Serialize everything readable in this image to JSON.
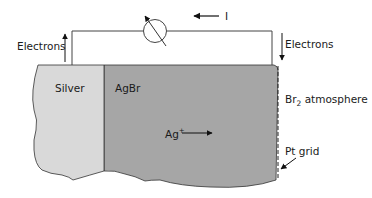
{
  "diagram": {
    "labels": {
      "current": "I",
      "electrons_left": "Electrons",
      "electrons_right": "Electrons",
      "silver": "Silver",
      "agbr": "AgBr",
      "ag_ion": "Ag",
      "ag_ion_charge": "+",
      "br2": "Br",
      "br2_subscript": "2",
      "br2_suffix": " atmosphere",
      "pt_grid": "Pt grid"
    },
    "components": {
      "meter": "galvanometer-symbol",
      "silver_region": "silver-electrode",
      "agbr_region": "silver-bromide-electrolyte",
      "pt_grid": "platinum-grid-electrode"
    },
    "colors": {
      "silver_fill": "#d9d9d9",
      "agbr_fill": "#a6a6a6",
      "stroke": "#333333",
      "wire": "#444444"
    }
  }
}
